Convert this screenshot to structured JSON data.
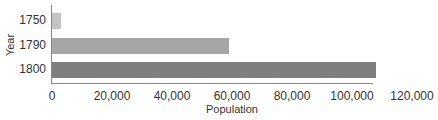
{
  "chart_data": {
    "type": "bar",
    "orientation": "horizontal",
    "title": "",
    "xlabel": "Population",
    "ylabel": "Year",
    "categories": [
      "1750",
      "1790",
      "1800"
    ],
    "values": [
      3000,
      59000,
      108000
    ],
    "xlim": [
      0,
      120000
    ],
    "x_ticks": [
      "0",
      "20,000",
      "40,000",
      "60,000",
      "80,000",
      "100,000",
      "120,000"
    ],
    "grid": false,
    "legend": null,
    "colors": [
      "#c4c4c4",
      "#a6a6a6",
      "#7f7f7f"
    ]
  }
}
